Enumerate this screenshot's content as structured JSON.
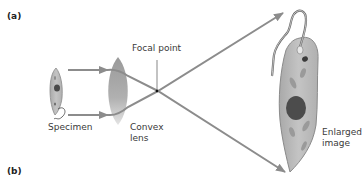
{
  "panels": [
    {
      "label": "(a)"
    },
    {
      "label": "(b)"
    }
  ],
  "labels": {
    "focal_point": "Focal point",
    "specimen": "Specimen",
    "convex_lens_line1": "Convex",
    "convex_lens_line2": "lens",
    "enlarged_line1": "Enlarged",
    "enlarged_line2": "image"
  },
  "colors": {
    "cell_fill": "#b8b8b8",
    "cell_edge": "#8a8a8a",
    "nucleus": "#4a4a4a",
    "lens": "#a8a8a8",
    "ray": "#8c8c8c",
    "text": "#3a3a3a"
  }
}
